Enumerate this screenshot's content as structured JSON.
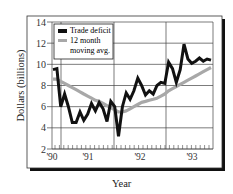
{
  "chart_data": {
    "type": "line",
    "title": "",
    "xlabel": "Year",
    "ylabel": "Dollars (billions)",
    "ylim": [
      2,
      14
    ],
    "yticks": [
      2,
      4,
      6,
      8,
      10,
      12,
      14
    ],
    "xtick_labels": [
      "'90",
      "'91",
      "'92",
      "'93"
    ],
    "grid": true,
    "legend_position": "upper left",
    "x_months": [
      0,
      1,
      2,
      3,
      4,
      5,
      6,
      7,
      8,
      9,
      10,
      11,
      12,
      13,
      14,
      15,
      16,
      17,
      18,
      19,
      20,
      21,
      22,
      23,
      24,
      25,
      26,
      27,
      28,
      29,
      30,
      31,
      32,
      33,
      34,
      35,
      36,
      37,
      38,
      39,
      40,
      41
    ],
    "series": [
      {
        "name": "Trade deficit",
        "color": "#111111",
        "values": [
          9.5,
          9.6,
          6.0,
          7.2,
          6.0,
          4.5,
          4.5,
          5.5,
          4.7,
          5.3,
          6.3,
          5.6,
          6.4,
          5.8,
          4.6,
          6.5,
          6.0,
          3.2,
          6.0,
          7.3,
          6.7,
          7.5,
          8.7,
          8.0,
          7.1,
          7.5,
          7.2,
          8.0,
          8.3,
          8.2,
          10.2,
          9.6,
          8.3,
          9.5,
          11.9,
          10.5,
          10.1,
          10.3,
          10.6,
          10.3,
          10.5,
          10.4
        ]
      },
      {
        "name": "12 month moving avg.",
        "color": "#a8a8a8",
        "values": [
          8.6,
          8.6,
          8.4,
          8.2,
          8.0,
          7.8,
          7.6,
          7.4,
          7.2,
          7.0,
          6.8,
          6.6,
          6.5,
          6.3,
          6.1,
          5.9,
          5.7,
          5.5,
          5.5,
          5.6,
          5.8,
          6.0,
          6.2,
          6.4,
          6.5,
          6.6,
          6.7,
          6.8,
          7.0,
          7.2,
          7.5,
          7.7,
          7.9,
          8.1,
          8.3,
          8.5,
          8.7,
          8.9,
          9.1,
          9.3,
          9.5,
          9.7
        ]
      }
    ]
  },
  "labels": {
    "ylabel": "Dollars (billions)",
    "xlabel": "Year",
    "legend": [
      "Trade deficit",
      "12 month",
      "moving avg."
    ]
  }
}
